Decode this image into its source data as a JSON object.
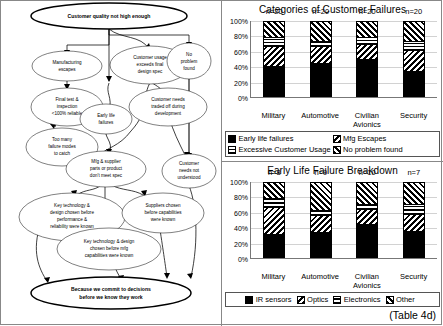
{
  "diagram": {
    "nodes": [
      {
        "id": "root",
        "label": "Customer quality not high enough"
      },
      {
        "id": "mfg_esc",
        "label": "Manufacturing\nescapes"
      },
      {
        "id": "final",
        "label": "Final test &\ninspection\n<100% reliable"
      },
      {
        "id": "toomany",
        "label": "Too many\nfailure modes\nto catch"
      },
      {
        "id": "earlylife",
        "label": "Early life\nfailures"
      },
      {
        "id": "usage",
        "label": "Customer usage\nexceeds final\ndesign spec"
      },
      {
        "id": "noprob",
        "label": "No\nproblem\nfound"
      },
      {
        "id": "traded",
        "label": "Customer needs\ntraded off during\ndevelopment"
      },
      {
        "id": "mfgsup",
        "label": "Mfg & supplier\nparts or product\ndon't meet spec"
      },
      {
        "id": "notunder",
        "label": "Customer\nneeds not\nunderstood"
      },
      {
        "id": "keytech1",
        "label": "Key technology &\ndesign chosen before\nperformance &\nreliability were known"
      },
      {
        "id": "suppliers",
        "label": "Suppliers chosen\nbefore capabilities\nwere known"
      },
      {
        "id": "keytech2",
        "label": "Key technology & design\nchosen before mfg\ncapabilities were known"
      },
      {
        "id": "commit",
        "label": "Because we commit to decisions\nbefore we know they work"
      }
    ]
  },
  "charts": [
    {
      "note": "",
      "chart_data": {
        "type": "bar",
        "stacked": true,
        "percent": true,
        "title": "Categories of Customer Failures",
        "xlabel": "",
        "ylabel": "",
        "ylim": [
          0,
          100
        ],
        "ytick_labels": [
          "0%",
          "20%",
          "40%",
          "60%",
          "80%",
          "100%"
        ],
        "yticks": [
          0,
          20,
          40,
          60,
          80,
          100
        ],
        "grid": true,
        "legend_position": "bottom",
        "categories": [
          "Military",
          "Automotive",
          "Civilian Avionics",
          "Security"
        ],
        "category_lines": [
          [
            "Military"
          ],
          [
            "Automotive"
          ],
          [
            "Civilian",
            "Avionics"
          ],
          [
            "Security"
          ]
        ],
        "sample_labels": [
          "n=20",
          "n=20",
          "n=20",
          "n=20"
        ],
        "series": [
          {
            "name": "Early life failures",
            "pattern": "solid",
            "values": [
              40,
              45,
              50,
              34
            ]
          },
          {
            "name": "Mfg Escapes",
            "pattern": "diagR",
            "values": [
              27,
              22,
              20,
              28
            ]
          },
          {
            "name": "Excessive Customer Usage",
            "pattern": "grid",
            "values": [
              13,
              8,
              10,
              13
            ]
          },
          {
            "name": "No problem found",
            "pattern": "diagL",
            "values": [
              20,
              25,
              20,
              25
            ]
          }
        ]
      }
    },
    {
      "note": "(Table 4d)",
      "chart_data": {
        "type": "bar",
        "stacked": true,
        "percent": true,
        "title": "Early Life Failure Breakdown",
        "xlabel": "",
        "ylabel": "",
        "ylim": [
          0,
          100
        ],
        "ytick_labels": [
          "0%",
          "20%",
          "40%",
          "60%",
          "80%",
          "100%"
        ],
        "yticks": [
          0,
          20,
          40,
          60,
          80,
          100
        ],
        "grid": true,
        "legend_position": "bottom",
        "categories": [
          "Military",
          "Automotive",
          "Civilian Avionics",
          "Security"
        ],
        "category_lines": [
          [
            "Military"
          ],
          [
            "Automotive"
          ],
          [
            "Civilian",
            "Avionics"
          ],
          [
            "Security"
          ]
        ],
        "sample_labels": [
          "n=8",
          "n=9",
          "n=10",
          "n=7"
        ],
        "series": [
          {
            "name": "IR sensors",
            "pattern": "solid",
            "values": [
              31,
              34,
              45,
              35
            ]
          },
          {
            "name": "Optics",
            "pattern": "diagR",
            "values": [
              37,
              23,
              20,
              23
            ]
          },
          {
            "name": "Electronics",
            "pattern": "hline",
            "values": [
              12,
              6,
              7,
              14
            ]
          },
          {
            "name": "Other",
            "pattern": "diagL",
            "values": [
              20,
              37,
              28,
              28
            ]
          }
        ]
      }
    }
  ]
}
